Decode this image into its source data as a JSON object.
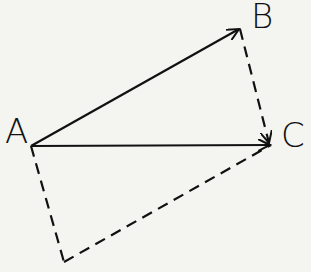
{
  "diagram": {
    "points": {
      "A": {
        "label": "A",
        "x": 31,
        "y": 146
      },
      "B": {
        "label": "B",
        "x": 240,
        "y": 29
      },
      "C": {
        "label": "C",
        "x": 271,
        "y": 145
      },
      "D": {
        "label": "",
        "x": 64,
        "y": 262
      }
    },
    "edges": [
      {
        "from": "A",
        "to": "B",
        "style": "solid",
        "arrow": true
      },
      {
        "from": "A",
        "to": "C",
        "style": "solid",
        "arrow": true
      },
      {
        "from": "B",
        "to": "C",
        "style": "dashed",
        "arrow": true
      },
      {
        "from": "A",
        "to": "D",
        "style": "dashed",
        "arrow": false
      },
      {
        "from": "D",
        "to": "C",
        "style": "dashed",
        "arrow": false
      }
    ],
    "colors": {
      "ink": "#111111",
      "paper": "#f4f4f1"
    }
  }
}
